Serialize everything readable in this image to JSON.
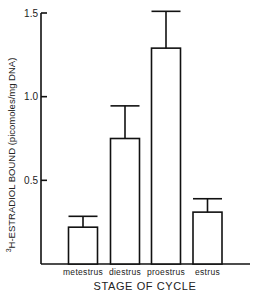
{
  "chart_data": {
    "type": "bar",
    "title": "",
    "categories": [
      "metestrus",
      "diestrus",
      "proestrus",
      "estrus"
    ],
    "values": [
      0.22,
      0.75,
      1.29,
      0.31
    ],
    "error_upper": [
      0.285,
      0.945,
      1.51,
      0.39
    ],
    "xlabel": "STAGE OF CYCLE",
    "ylabel_superscript": "3",
    "ylabel": "H-ESTRADIOL BOUND (picomoles/mg DNA)",
    "ylim": [
      0,
      1.5
    ],
    "yticks": [
      0.5,
      1.0,
      1.5
    ],
    "ytick_labels": [
      "0.5",
      "1.0",
      "1.5"
    ],
    "grid": false,
    "legend": "none"
  }
}
